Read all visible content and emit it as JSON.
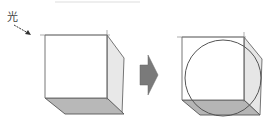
{
  "diagram": {
    "light_label": "光",
    "colors": {
      "edge": "#555555",
      "front_face": "#ffffff",
      "side_face": "#e6e6e6",
      "bottom_face": "#b5b5b5",
      "arrow": "#7a7a7a",
      "circle": "#555555"
    },
    "panels": [
      {
        "name": "cube",
        "description": "Cube lit from upper-left"
      },
      {
        "name": "cube-with-inscribed-circle",
        "description": "Same cube with circle inscribed in front face"
      }
    ],
    "transition_arrow": "right"
  }
}
